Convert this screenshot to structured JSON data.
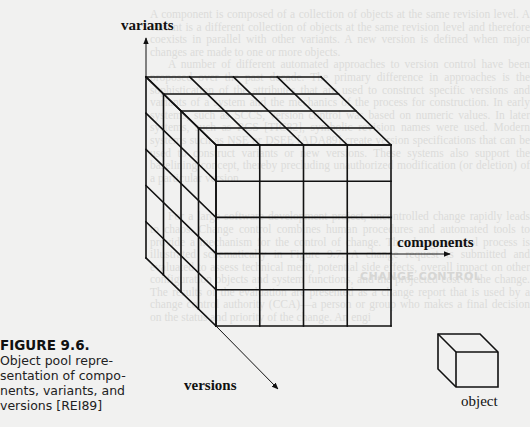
{
  "figure": {
    "number": "FIGURE 9.6.",
    "caption": "Object pool representation of components, variants, and versions [REI89]",
    "caption_lines": [
      "Object pool repre-",
      "sentation of compo-",
      "nents, variants, and",
      "versions [REI89]"
    ]
  },
  "diagram": {
    "axis_labels": {
      "variants": "variants",
      "components": "components",
      "versions": "versions"
    },
    "legend_label": "object",
    "grid": {
      "components": 4,
      "variants": 5,
      "versions": 4
    }
  },
  "background_text": {
    "paragraphs": [
      "A component is composed of a collection of objects at the same revision level. A variant is a different collection of objects at the same revision level and therefore coexists in parallel with other variants. A new version is defined when major changes are made to one or more objects.",
      "A number of different automated approaches to version control have been proposed over the past decade. The primary difference in approaches is the sophistication of the attributes that are used to construct specific versions and variants of a system and the mechanics of the process for construction. In early systems, such as SCCS, version control was based on numeric values. In later systems, such as RCS [TIC82], symbolic revision names were used. Modern systems such as NSE or DSEE [ADA89] create version specifications that can be used to construct variants or new versions. These systems also support the baselining concept, thereby precluding unauthorized modification (or deletion) of a particular version."
    ],
    "section_heading": "CHANGE CONTROL",
    "paragraphs_after": [
      "For a large software development project, uncontrolled change rapidly leads to chaos. Change control combines human procedures and automated tools to provide a mechanism for the control of change. The change control process is illustrated schematically in Figure 9.7. A change request is submitted and evaluated to assess technical merit, potential side effects, overall impact on other configuration objects and system functions, and the projected cost of the change. The results of the evaluation are presented as a change report that is used by a change control authority (CCA)—a person or group who makes a final decision on the status and priority of the change. An engi"
    ]
  }
}
